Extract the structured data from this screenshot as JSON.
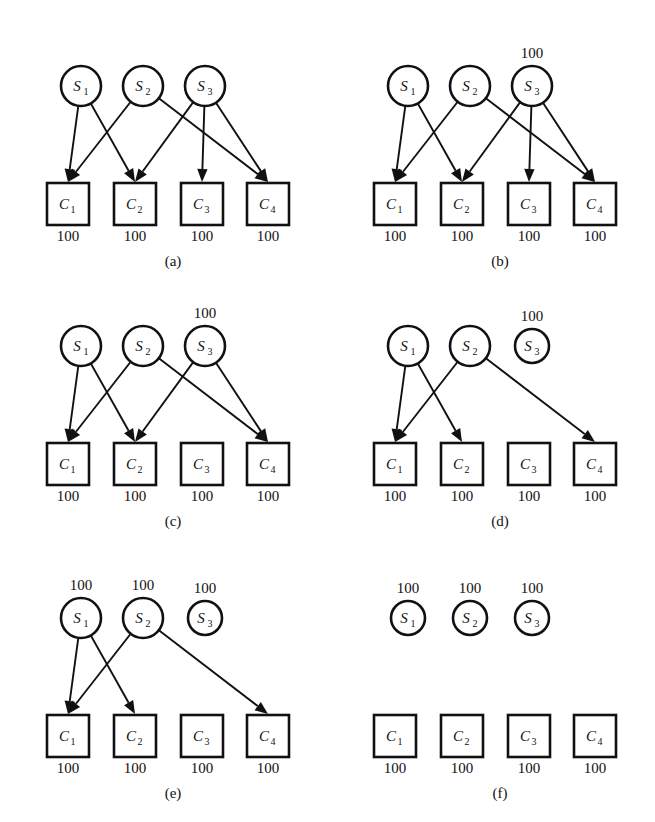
{
  "figure": {
    "layout": {
      "rows": 3,
      "cols": 2,
      "panel_width": 327,
      "panel_height": 274
    },
    "colors": {
      "stroke": "#111111",
      "fill": "#ffffff",
      "background": "#ffffff"
    },
    "source_labels": [
      "S",
      "S",
      "S"
    ],
    "source_subs": [
      "1",
      "2",
      "3"
    ],
    "client_labels": [
      "C",
      "C",
      "C",
      "C"
    ],
    "client_subs": [
      "1",
      "2",
      "3",
      "4"
    ],
    "capacity_value": "100"
  },
  "chart_data": {
    "type": "diagram",
    "node_sets": {
      "sources": [
        {
          "id": "S1",
          "label": "S",
          "sub": "1",
          "shape": "circle"
        },
        {
          "id": "S2",
          "label": "S",
          "sub": "2",
          "shape": "circle"
        },
        {
          "id": "S3",
          "label": "S",
          "sub": "3",
          "shape": "circle"
        }
      ],
      "clients": [
        {
          "id": "C1",
          "label": "C",
          "sub": "1",
          "shape": "square"
        },
        {
          "id": "C2",
          "label": "C",
          "sub": "2",
          "shape": "square"
        },
        {
          "id": "C3",
          "label": "C",
          "sub": "3",
          "shape": "square"
        },
        {
          "id": "C4",
          "label": "C",
          "sub": "4",
          "shape": "square"
        }
      ]
    },
    "panels": [
      {
        "id": "a",
        "caption": "(a)",
        "edges": [
          {
            "from": "S1",
            "to": "C1"
          },
          {
            "from": "S1",
            "to": "C2"
          },
          {
            "from": "S2",
            "to": "C1"
          },
          {
            "from": "S2",
            "to": "C4"
          },
          {
            "from": "S3",
            "to": "C2"
          },
          {
            "from": "S3",
            "to": "C3"
          },
          {
            "from": "S3",
            "to": "C4"
          }
        ],
        "source_caps": [
          "",
          "",
          ""
        ],
        "client_caps": [
          "100",
          "100",
          "100",
          "100"
        ],
        "small_sources": []
      },
      {
        "id": "b",
        "caption": "(b)",
        "edges": [
          {
            "from": "S1",
            "to": "C1"
          },
          {
            "from": "S1",
            "to": "C2"
          },
          {
            "from": "S2",
            "to": "C1"
          },
          {
            "from": "S2",
            "to": "C4"
          },
          {
            "from": "S3",
            "to": "C2"
          },
          {
            "from": "S3",
            "to": "C3"
          },
          {
            "from": "S3",
            "to": "C4"
          }
        ],
        "source_caps": [
          "",
          "",
          "100"
        ],
        "client_caps": [
          "100",
          "100",
          "100",
          "100"
        ],
        "small_sources": []
      },
      {
        "id": "c",
        "caption": "(c)",
        "edges": [
          {
            "from": "S1",
            "to": "C1"
          },
          {
            "from": "S1",
            "to": "C2"
          },
          {
            "from": "S2",
            "to": "C1"
          },
          {
            "from": "S2",
            "to": "C4"
          },
          {
            "from": "S3",
            "to": "C2"
          },
          {
            "from": "S3",
            "to": "C4"
          }
        ],
        "source_caps": [
          "",
          "",
          "100"
        ],
        "client_caps": [
          "100",
          "100",
          "100",
          "100"
        ],
        "small_sources": []
      },
      {
        "id": "d",
        "caption": "(d)",
        "edges": [
          {
            "from": "S1",
            "to": "C1"
          },
          {
            "from": "S1",
            "to": "C2"
          },
          {
            "from": "S2",
            "to": "C1"
          },
          {
            "from": "S2",
            "to": "C4"
          }
        ],
        "source_caps": [
          "",
          "",
          "100"
        ],
        "client_caps": [
          "100",
          "100",
          "100",
          "100"
        ],
        "small_sources": [
          "S3"
        ]
      },
      {
        "id": "e",
        "caption": "(e)",
        "edges": [
          {
            "from": "S1",
            "to": "C1"
          },
          {
            "from": "S1",
            "to": "C2"
          },
          {
            "from": "S2",
            "to": "C1"
          },
          {
            "from": "S2",
            "to": "C4"
          }
        ],
        "source_caps": [
          "100",
          "100",
          "100"
        ],
        "client_caps": [
          "100",
          "100",
          "100",
          "100"
        ],
        "small_sources": [
          "S3"
        ]
      },
      {
        "id": "f",
        "caption": "(f)",
        "edges": [],
        "source_caps": [
          "100",
          "100",
          "100"
        ],
        "client_caps": [
          "100",
          "100",
          "100",
          "100"
        ],
        "small_sources": [
          "S1",
          "S2",
          "S3"
        ]
      }
    ]
  }
}
